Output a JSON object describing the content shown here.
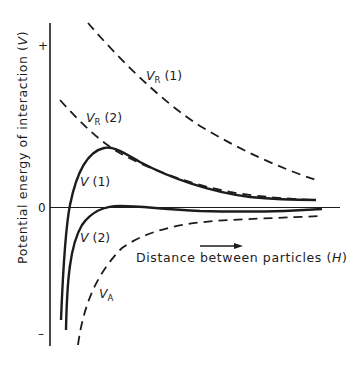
{
  "figure": {
    "y_axis": {
      "label": "Potential energy of interaction (V)",
      "label_text": "Potential energy of interaction (",
      "label_var": "V",
      "label_close": ")",
      "ticks": {
        "plus": "+",
        "zero": "0",
        "minus": "–"
      }
    },
    "x_axis": {
      "label_text": "Distance between particles (",
      "label_var": "H",
      "label_close": ")",
      "arrow": "right-arrow"
    },
    "curves": [
      {
        "id": "VR1",
        "name": "V",
        "sub": "R",
        "suffix": " (1)",
        "style": "dashed",
        "description": "repulsive energy, case 1"
      },
      {
        "id": "VR2",
        "name": "V",
        "sub": "R",
        "suffix": " (2)",
        "style": "dashed",
        "description": "repulsive energy, case 2"
      },
      {
        "id": "V1",
        "name": "V",
        "sub": "",
        "suffix": " (1)",
        "style": "solid",
        "description": "total energy, case 1"
      },
      {
        "id": "V2",
        "name": "V",
        "sub": "",
        "suffix": " (2)",
        "style": "solid",
        "description": "total energy, case 2"
      },
      {
        "id": "VA",
        "name": "V",
        "sub": "A",
        "suffix": "",
        "style": "dashed",
        "description": "attractive energy"
      }
    ],
    "colors": {
      "ink": "#1c1c1c",
      "background": "#ffffff"
    }
  }
}
